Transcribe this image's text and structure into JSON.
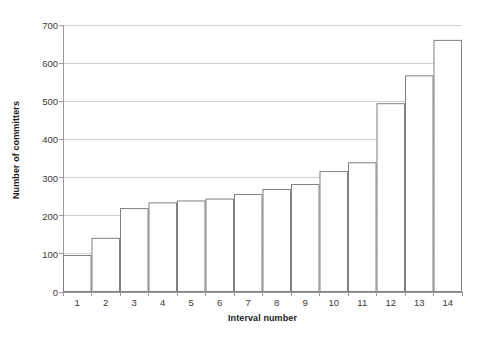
{
  "chart_data": {
    "type": "bar",
    "title": "",
    "xlabel": "Interval number",
    "ylabel": "Number of committers",
    "categories": [
      "1",
      "2",
      "3",
      "4",
      "5",
      "6",
      "7",
      "8",
      "9",
      "10",
      "11",
      "12",
      "13",
      "14"
    ],
    "values": [
      97,
      142,
      220,
      235,
      240,
      245,
      257,
      270,
      283,
      317,
      340,
      495,
      568,
      661
    ],
    "series": [
      {
        "name": "Number of committers",
        "values": [
          97,
          142,
          220,
          235,
          240,
          245,
          257,
          270,
          283,
          317,
          340,
          495,
          568,
          661
        ]
      }
    ],
    "ylim": [
      0,
      700
    ],
    "ytick_labels": [
      "0",
      "100",
      "200",
      "300",
      "400",
      "500",
      "600",
      "700"
    ],
    "ytick_values": [
      0,
      100,
      200,
      300,
      400,
      500,
      600,
      700
    ],
    "xtick_labels": [
      "1",
      "2",
      "3",
      "4",
      "5",
      "6",
      "7",
      "8",
      "9",
      "10",
      "11",
      "12",
      "13",
      "14"
    ],
    "grid": "horizontal",
    "legend": "none",
    "bar_fill_color": "#ffffff",
    "bar_border_color": "#808080",
    "gridline_color": "#cfcfcf",
    "axis_color": "#9a9a9a",
    "text_color": "#3a3a3a"
  }
}
